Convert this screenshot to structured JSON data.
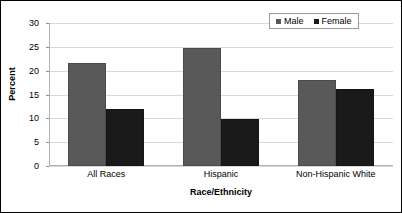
{
  "chart_data": {
    "type": "bar",
    "title": "",
    "subtitle": "",
    "xlabel": "Race/Ethnicity",
    "ylabel": "Percent",
    "categories": [
      "All Races",
      "Hispanic",
      "Non-Hispanic White"
    ],
    "series": [
      {
        "name": "Male",
        "color": "#595959",
        "values": [
          21.7,
          24.8,
          18.0
        ]
      },
      {
        "name": "Female",
        "color": "#1a1a1a",
        "values": [
          12.0,
          9.9,
          16.1
        ]
      }
    ],
    "ylim": [
      0,
      30
    ],
    "ytick_step": 5,
    "ytick_labels": [
      "0",
      "5",
      "10",
      "15",
      "20",
      "25",
      "30"
    ],
    "ytick_values": [
      0,
      5,
      10,
      15,
      20,
      25,
      30
    ],
    "grid": true,
    "grid_axis": "y",
    "legend_position": "top-right",
    "legend_entries": [
      "Male",
      "Female"
    ],
    "bar_gap_within_group": 0,
    "frame_border": true
  },
  "colors": {
    "male": "#595959",
    "female": "#1a1a1a",
    "gridline": "#d9d9d9",
    "axis": "#b0b0b0",
    "frame": "#000000",
    "text": "#000000",
    "legend_border": "#9a9a9a",
    "background": "#ffffff"
  }
}
